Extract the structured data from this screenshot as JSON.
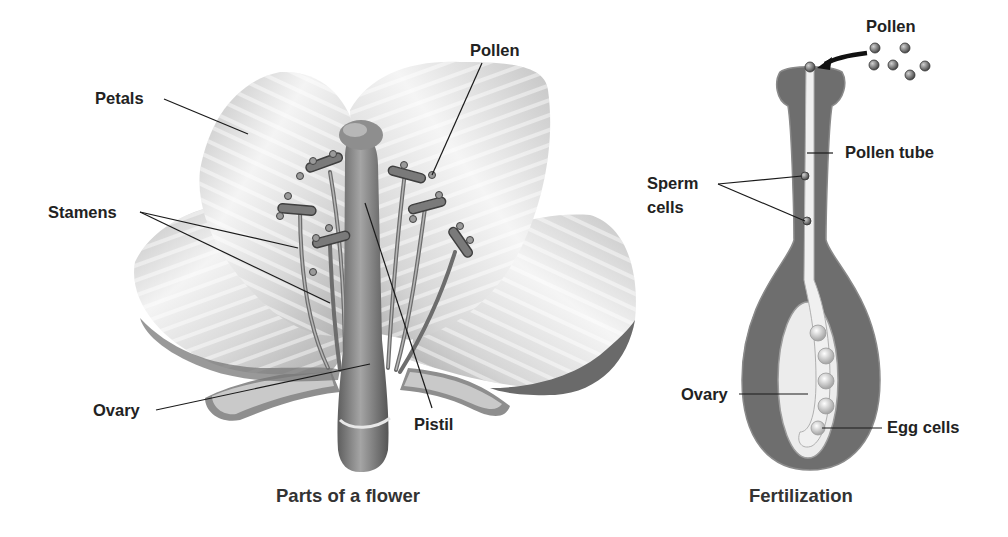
{
  "figure": {
    "panels": [
      {
        "id": "flower",
        "caption": "Parts of a flower",
        "labels": {
          "petals": "Petals",
          "stamens": "Stamens",
          "ovary": "Ovary",
          "pistil": "Pistil",
          "pollen": "Pollen"
        }
      },
      {
        "id": "fertilization",
        "caption": "Fertilization",
        "labels": {
          "pollen": "Pollen",
          "pollen_tube": "Pollen tube",
          "sperm_cells_line1": "Sperm",
          "sperm_cells_line2": "cells",
          "ovary": "Ovary",
          "egg_cells": "Egg cells"
        }
      }
    ],
    "colors": {
      "label_text": "#222222",
      "leader_line": "#1a1a1a",
      "petal_light": "#f2f2f2",
      "petal_shade": "#9a9a9a",
      "pistil": "#7d7d7d",
      "tube_body": "#6e6e6e",
      "tube_core": "#f0f0f0"
    }
  }
}
